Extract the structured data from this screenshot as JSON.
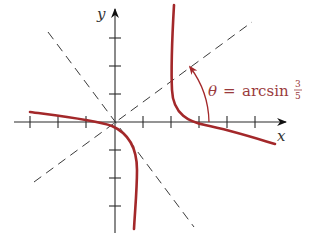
{
  "diagram": {
    "axes": {
      "x_label": "x",
      "y_label": "y"
    },
    "annotation": {
      "symbol": "θ",
      "equals": "=",
      "function": "arcsin",
      "fraction_numerator": "3",
      "fraction_denominator": "5"
    },
    "colors": {
      "curve": "#a3282a",
      "annotation": "#9a3a3c",
      "axis": "#2a2a2a"
    },
    "elements": [
      "hyperbola with two branches",
      "two dashed asymptotes through origin",
      "angle arc between x-axis and asymptote"
    ]
  }
}
